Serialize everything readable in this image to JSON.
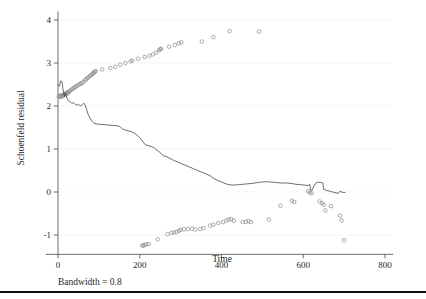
{
  "figure": {
    "caption": "Bandwidth = 0.8"
  },
  "chart_data": {
    "type": "scatter",
    "title": "",
    "xlabel": "Time",
    "ylabel": "Schoenfeld residual",
    "xlim": [
      -30,
      820
    ],
    "ylim": [
      -1.45,
      4.15
    ],
    "xticks": [
      0,
      200,
      400,
      600,
      800
    ],
    "xtick_labels": [
      "0",
      "200",
      "400",
      "600",
      "800"
    ],
    "yticks": [
      -1,
      0,
      1,
      2,
      3,
      4
    ],
    "ytick_labels": [
      "-1",
      "0",
      "1",
      "2",
      "3",
      "4"
    ],
    "grid": "horizontal-faint",
    "legend": "none",
    "marker": "open-circle",
    "marker_color": "#8a8a8a",
    "line_color": "#3c3c3c",
    "series": [
      {
        "name": "Schoenfeld residuals (upper band)",
        "type": "scatter",
        "points": [
          [
            2,
            2.22
          ],
          [
            4,
            2.23
          ],
          [
            6,
            2.24
          ],
          [
            8,
            2.21
          ],
          [
            10,
            2.25
          ],
          [
            12,
            2.23
          ],
          [
            14,
            2.26
          ],
          [
            16,
            2.28
          ],
          [
            18,
            2.27
          ],
          [
            20,
            2.3
          ],
          [
            22,
            2.31
          ],
          [
            24,
            2.29
          ],
          [
            26,
            2.33
          ],
          [
            28,
            2.34
          ],
          [
            30,
            2.36
          ],
          [
            33,
            2.38
          ],
          [
            36,
            2.4
          ],
          [
            39,
            2.42
          ],
          [
            42,
            2.44
          ],
          [
            45,
            2.46
          ],
          [
            48,
            2.48
          ],
          [
            52,
            2.5
          ],
          [
            56,
            2.53
          ],
          [
            58,
            2.52
          ],
          [
            62,
            2.56
          ],
          [
            66,
            2.6
          ],
          [
            69,
            2.62
          ],
          [
            72,
            2.65
          ],
          [
            75,
            2.67
          ],
          [
            78,
            2.7
          ],
          [
            81,
            2.72
          ],
          [
            84,
            2.74
          ],
          [
            86,
            2.76
          ],
          [
            88,
            2.78
          ],
          [
            90,
            2.8
          ],
          [
            92,
            2.81
          ],
          [
            108,
            2.85
          ],
          [
            128,
            2.88
          ],
          [
            140,
            2.91
          ],
          [
            152,
            2.96
          ],
          [
            165,
            3.0
          ],
          [
            178,
            3.04
          ],
          [
            182,
            3.06
          ],
          [
            196,
            3.1
          ],
          [
            212,
            3.14
          ],
          [
            224,
            3.17
          ],
          [
            232,
            3.2
          ],
          [
            240,
            3.24
          ],
          [
            248,
            3.3
          ],
          [
            250,
            3.32
          ],
          [
            252,
            3.33
          ],
          [
            272,
            3.38
          ],
          [
            286,
            3.42
          ],
          [
            296,
            3.46
          ],
          [
            302,
            3.48
          ],
          [
            352,
            3.5
          ],
          [
            380,
            3.6
          ],
          [
            420,
            3.74
          ],
          [
            492,
            3.73
          ]
        ]
      },
      {
        "name": "Schoenfeld residuals (lower band)",
        "type": "scatter",
        "points": [
          [
            206,
            -1.24
          ],
          [
            209,
            -1.25
          ],
          [
            212,
            -1.23
          ],
          [
            216,
            -1.22
          ],
          [
            222,
            -1.21
          ],
          [
            244,
            -1.1
          ],
          [
            268,
            -0.98
          ],
          [
            278,
            -0.95
          ],
          [
            284,
            -0.94
          ],
          [
            290,
            -0.93
          ],
          [
            296,
            -0.9
          ],
          [
            300,
            -0.88
          ],
          [
            308,
            -0.87
          ],
          [
            318,
            -0.86
          ],
          [
            328,
            -0.85
          ],
          [
            336,
            -0.87
          ],
          [
            348,
            -0.86
          ],
          [
            356,
            -0.84
          ],
          [
            372,
            -0.78
          ],
          [
            380,
            -0.76
          ],
          [
            392,
            -0.72
          ],
          [
            404,
            -0.7
          ],
          [
            412,
            -0.66
          ],
          [
            418,
            -0.64
          ],
          [
            424,
            -0.63
          ],
          [
            430,
            -0.67
          ],
          [
            452,
            -0.7
          ],
          [
            460,
            -0.69
          ],
          [
            466,
            -0.68
          ],
          [
            472,
            -0.7
          ],
          [
            516,
            -0.64
          ],
          [
            544,
            -0.32
          ],
          [
            572,
            -0.2
          ],
          [
            578,
            -0.23
          ],
          [
            612,
            0.02
          ],
          [
            616,
            -0.01
          ],
          [
            620,
            -0.03
          ],
          [
            640,
            -0.22
          ],
          [
            646,
            -0.26
          ],
          [
            650,
            -0.3
          ],
          [
            654,
            -0.43
          ],
          [
            668,
            -0.33
          ],
          [
            690,
            -0.55
          ],
          [
            694,
            -0.66
          ],
          [
            700,
            -1.12
          ]
        ]
      },
      {
        "name": "LOWESS smooth",
        "type": "line",
        "points": [
          [
            0,
            2.5
          ],
          [
            4,
            2.46
          ],
          [
            6,
            2.58
          ],
          [
            10,
            2.56
          ],
          [
            12,
            2.4
          ],
          [
            14,
            2.3
          ],
          [
            16,
            2.22
          ],
          [
            18,
            2.3
          ],
          [
            20,
            2.24
          ],
          [
            22,
            2.18
          ],
          [
            26,
            2.12
          ],
          [
            30,
            2.1
          ],
          [
            34,
            2.06
          ],
          [
            38,
            2.08
          ],
          [
            42,
            2.04
          ],
          [
            46,
            2.02
          ],
          [
            50,
            2.04
          ],
          [
            54,
            2.0
          ],
          [
            58,
            2.02
          ],
          [
            62,
            2.06
          ],
          [
            66,
            2.04
          ],
          [
            70,
            1.92
          ],
          [
            74,
            1.8
          ],
          [
            78,
            1.72
          ],
          [
            82,
            1.66
          ],
          [
            88,
            1.6
          ],
          [
            96,
            1.58
          ],
          [
            108,
            1.57
          ],
          [
            120,
            1.56
          ],
          [
            132,
            1.55
          ],
          [
            146,
            1.54
          ],
          [
            152,
            1.52
          ],
          [
            158,
            1.46
          ],
          [
            166,
            1.44
          ],
          [
            172,
            1.42
          ],
          [
            180,
            1.4
          ],
          [
            188,
            1.36
          ],
          [
            196,
            1.3
          ],
          [
            204,
            1.22
          ],
          [
            210,
            1.14
          ],
          [
            214,
            1.1
          ],
          [
            220,
            1.08
          ],
          [
            228,
            1.06
          ],
          [
            236,
            1.02
          ],
          [
            244,
            0.96
          ],
          [
            252,
            0.9
          ],
          [
            258,
            0.84
          ],
          [
            266,
            0.82
          ],
          [
            274,
            0.78
          ],
          [
            282,
            0.74
          ],
          [
            292,
            0.7
          ],
          [
            302,
            0.66
          ],
          [
            312,
            0.62
          ],
          [
            322,
            0.58
          ],
          [
            332,
            0.54
          ],
          [
            342,
            0.5
          ],
          [
            352,
            0.46
          ],
          [
            362,
            0.42
          ],
          [
            372,
            0.38
          ],
          [
            380,
            0.32
          ],
          [
            388,
            0.28
          ],
          [
            398,
            0.24
          ],
          [
            408,
            0.2
          ],
          [
            418,
            0.17
          ],
          [
            430,
            0.16
          ],
          [
            442,
            0.17
          ],
          [
            452,
            0.18
          ],
          [
            464,
            0.19
          ],
          [
            476,
            0.2
          ],
          [
            488,
            0.22
          ],
          [
            498,
            0.23
          ],
          [
            510,
            0.24
          ],
          [
            522,
            0.23
          ],
          [
            534,
            0.22
          ],
          [
            546,
            0.21
          ],
          [
            558,
            0.21
          ],
          [
            570,
            0.2
          ],
          [
            582,
            0.18
          ],
          [
            594,
            0.17
          ],
          [
            604,
            0.16
          ],
          [
            612,
            0.15
          ],
          [
            616,
            0.18
          ],
          [
            618,
            0.05
          ],
          [
            622,
            0.04
          ],
          [
            626,
            0.14
          ],
          [
            632,
            0.22
          ],
          [
            638,
            0.23
          ],
          [
            644,
            0.22
          ],
          [
            648,
            0.21
          ],
          [
            650,
            0.06
          ],
          [
            656,
            0.04
          ],
          [
            664,
            0.02
          ],
          [
            672,
            0.0
          ],
          [
            680,
            -0.02
          ],
          [
            686,
            -0.03
          ],
          [
            690,
            0.02
          ],
          [
            694,
            0.0
          ],
          [
            698,
            -0.01
          ],
          [
            702,
            -0.01
          ]
        ]
      }
    ]
  }
}
